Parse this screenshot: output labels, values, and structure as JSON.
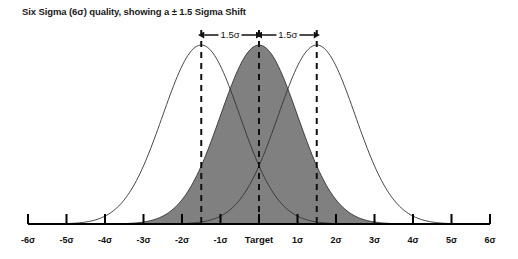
{
  "title": "Six Sigma (6σ) quality, showing a ± 1.5 Sigma Shift",
  "colors": {
    "curve_fill": "#808080",
    "curve_stroke": "#333333",
    "axis": "#000000",
    "text": "#111111",
    "background": "#ffffff"
  },
  "axis": {
    "label_target": "Target",
    "ticks": [
      {
        "label": "-6σ",
        "value": -6
      },
      {
        "label": "-5σ",
        "value": -5
      },
      {
        "label": "-4σ",
        "value": -4
      },
      {
        "label": "-3σ",
        "value": -3
      },
      {
        "label": "-2σ",
        "value": -2
      },
      {
        "label": "-1σ",
        "value": -1
      },
      {
        "label": "Target",
        "value": 0
      },
      {
        "label": "1σ",
        "value": 1
      },
      {
        "label": "2σ",
        "value": 2
      },
      {
        "label": "3σ",
        "value": 3
      },
      {
        "label": "4σ",
        "value": 4
      },
      {
        "label": "5σ",
        "value": 5
      },
      {
        "label": "6σ",
        "value": 6
      }
    ]
  },
  "annotations": {
    "shift_left_label": "1.5σ",
    "shift_right_label": "1.5σ"
  },
  "chart_data": {
    "type": "line",
    "title": "Six Sigma (6σ) quality, showing a ± 1.5 Sigma Shift",
    "xlabel": "",
    "ylabel": "",
    "xlim": [
      -6,
      6
    ],
    "ylim": [
      0,
      1
    ],
    "grid": false,
    "legend": null,
    "x_tick_labels": [
      "-6σ",
      "-5σ",
      "-4σ",
      "-3σ",
      "-2σ",
      "-1σ",
      "Target",
      "1σ",
      "2σ",
      "3σ",
      "4σ",
      "5σ",
      "6σ"
    ],
    "x_tick_values": [
      -6,
      -5,
      -4,
      -3,
      -2,
      -1,
      0,
      1,
      2,
      3,
      4,
      5,
      6
    ],
    "series": [
      {
        "name": "Shifted left distribution (-1.5σ)",
        "type": "normal",
        "mean": -1.5,
        "sigma": 1.0,
        "peak": 1.0,
        "fill": "none",
        "stroke": "#333333"
      },
      {
        "name": "Centered distribution (Target)",
        "type": "normal",
        "mean": 0.0,
        "sigma": 1.0,
        "peak": 1.0,
        "fill": "#808080",
        "stroke": "#333333"
      },
      {
        "name": "Shifted right distribution (+1.5σ)",
        "type": "normal",
        "mean": 1.5,
        "sigma": 1.0,
        "peak": 1.0,
        "fill": "none",
        "stroke": "#333333"
      }
    ],
    "vertical_markers": [
      {
        "label": "-1.5σ shift",
        "value": -1.5,
        "style": "dashed"
      },
      {
        "label": "Target",
        "value": 0,
        "style": "dashed"
      },
      {
        "label": "+1.5σ shift",
        "value": 1.5,
        "style": "dashed"
      }
    ],
    "annotations": [
      {
        "text": "1.5σ",
        "from": -1.5,
        "to": 0.0,
        "kind": "double-arrow"
      },
      {
        "text": "1.5σ",
        "from": 0.0,
        "to": 1.5,
        "kind": "double-arrow"
      }
    ]
  }
}
